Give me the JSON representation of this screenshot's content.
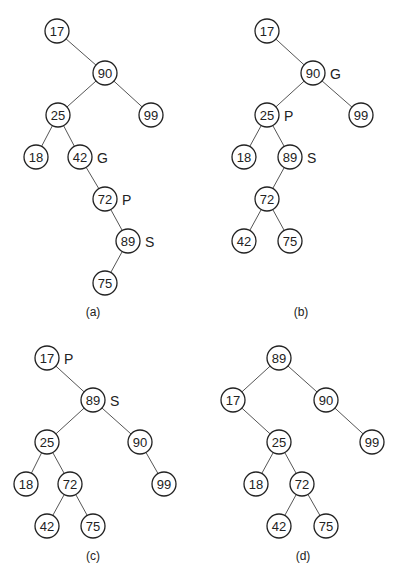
{
  "diagram": {
    "type": "binary-search-tree-splay-steps",
    "node_radius": 12,
    "panels": [
      {
        "id": "a",
        "caption": "(a)",
        "caption_pos": [
          93,
          312
        ],
        "nodes": [
          {
            "value": "17",
            "x": 57,
            "y": 31
          },
          {
            "value": "90",
            "x": 105,
            "y": 73
          },
          {
            "value": "25",
            "x": 58,
            "y": 115
          },
          {
            "value": "99",
            "x": 151,
            "y": 115
          },
          {
            "value": "18",
            "x": 36,
            "y": 157
          },
          {
            "value": "42",
            "x": 80,
            "y": 157,
            "tag": "G"
          },
          {
            "value": "72",
            "x": 105,
            "y": 199,
            "tag": "P"
          },
          {
            "value": "89",
            "x": 128,
            "y": 241,
            "tag": "S"
          },
          {
            "value": "75",
            "x": 105,
            "y": 283
          }
        ],
        "edges": [
          [
            "17",
            "90"
          ],
          [
            "90",
            "25"
          ],
          [
            "90",
            "99"
          ],
          [
            "25",
            "18"
          ],
          [
            "25",
            "42"
          ],
          [
            "42",
            "72"
          ],
          [
            "72",
            "89"
          ],
          [
            "89",
            "75"
          ]
        ]
      },
      {
        "id": "b",
        "caption": "(b)",
        "caption_pos": [
          301,
          312
        ],
        "nodes": [
          {
            "value": "17",
            "x": 267,
            "y": 31
          },
          {
            "value": "90",
            "x": 313,
            "y": 73,
            "tag": "G"
          },
          {
            "value": "25",
            "x": 267,
            "y": 115,
            "tag": "P"
          },
          {
            "value": "99",
            "x": 361,
            "y": 115
          },
          {
            "value": "18",
            "x": 244,
            "y": 157
          },
          {
            "value": "89",
            "x": 290,
            "y": 157,
            "tag": "S"
          },
          {
            "value": "72",
            "x": 267,
            "y": 199
          },
          {
            "value": "42",
            "x": 244,
            "y": 241
          },
          {
            "value": "75",
            "x": 290,
            "y": 241
          }
        ],
        "edges": [
          [
            "17",
            "90"
          ],
          [
            "90",
            "25"
          ],
          [
            "90",
            "99"
          ],
          [
            "25",
            "18"
          ],
          [
            "25",
            "89"
          ],
          [
            "89",
            "72"
          ],
          [
            "72",
            "42"
          ],
          [
            "72",
            "75"
          ]
        ]
      },
      {
        "id": "c",
        "caption": "(c)",
        "caption_pos": [
          93,
          556
        ],
        "nodes": [
          {
            "value": "17",
            "x": 47,
            "y": 358,
            "tag": "P"
          },
          {
            "value": "89",
            "x": 93,
            "y": 400,
            "tag": "S"
          },
          {
            "value": "25",
            "x": 47,
            "y": 442
          },
          {
            "value": "90",
            "x": 140,
            "y": 442
          },
          {
            "value": "18",
            "x": 26,
            "y": 484
          },
          {
            "value": "72",
            "x": 70,
            "y": 484
          },
          {
            "value": "99",
            "x": 164,
            "y": 484
          },
          {
            "value": "42",
            "x": 47,
            "y": 526
          },
          {
            "value": "75",
            "x": 93,
            "y": 526
          }
        ],
        "edges": [
          [
            "17",
            "89"
          ],
          [
            "89",
            "25"
          ],
          [
            "89",
            "90"
          ],
          [
            "25",
            "18"
          ],
          [
            "25",
            "72"
          ],
          [
            "90",
            "99"
          ],
          [
            "72",
            "42"
          ],
          [
            "72",
            "75"
          ]
        ]
      },
      {
        "id": "d",
        "caption": "(d)",
        "caption_pos": [
          303,
          556
        ],
        "nodes": [
          {
            "value": "89",
            "x": 279,
            "y": 358
          },
          {
            "value": "17",
            "x": 233,
            "y": 400
          },
          {
            "value": "90",
            "x": 326,
            "y": 400
          },
          {
            "value": "25",
            "x": 279,
            "y": 442
          },
          {
            "value": "99",
            "x": 372,
            "y": 442
          },
          {
            "value": "18",
            "x": 256,
            "y": 484
          },
          {
            "value": "72",
            "x": 302,
            "y": 484
          },
          {
            "value": "42",
            "x": 279,
            "y": 526
          },
          {
            "value": "75",
            "x": 326,
            "y": 526
          }
        ],
        "edges": [
          [
            "89",
            "17"
          ],
          [
            "89",
            "90"
          ],
          [
            "17",
            "25"
          ],
          [
            "90",
            "99"
          ],
          [
            "25",
            "18"
          ],
          [
            "25",
            "72"
          ],
          [
            "72",
            "42"
          ],
          [
            "72",
            "75"
          ]
        ]
      }
    ]
  }
}
